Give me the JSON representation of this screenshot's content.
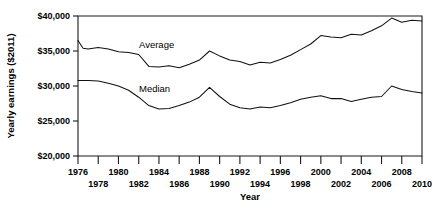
{
  "chart_data": {
    "type": "line",
    "title": "",
    "xlabel": "Year",
    "ylabel": "Yearly earnings ($2011)",
    "xlim": [
      1976,
      2010
    ],
    "ylim": [
      20000,
      40000
    ],
    "grid": false,
    "legend_position": "inline-annotations",
    "y_ticks": [
      20000,
      25000,
      30000,
      35000,
      40000
    ],
    "y_tick_labels": [
      "$20,000",
      "$25,000",
      "$30,000",
      "$35,000",
      "$40,000"
    ],
    "x_ticks": [
      1976,
      1978,
      1980,
      1982,
      1984,
      1986,
      1988,
      1990,
      1992,
      1994,
      1996,
      1998,
      2000,
      2002,
      2004,
      2006,
      2008,
      2010
    ],
    "x_tick_labels": [
      "1976",
      "1978",
      "1980",
      "1982",
      "1984",
      "1986",
      "1988",
      "1990",
      "1992",
      "1994",
      "1996",
      "1998",
      "2000",
      "2002",
      "2004",
      "2006",
      "2008",
      "2010"
    ],
    "x": [
      1976,
      1977,
      1978,
      1979,
      1980,
      1981,
      1982,
      1983,
      1984,
      1985,
      1986,
      1987,
      1988,
      1989,
      1990,
      1991,
      1992,
      1993,
      1994,
      1995,
      1996,
      1997,
      1998,
      1999,
      2000,
      2001,
      2002,
      2003,
      2004,
      2005,
      2006,
      2007,
      2008,
      2009,
      2010
    ],
    "series": [
      {
        "name": "Average",
        "label": "Average",
        "annotation_x": 1981.0,
        "annotation_y": 36400,
        "values": [
          36500,
          35300,
          35500,
          35200,
          34900,
          34800,
          34600,
          33900,
          32800,
          32700,
          32800,
          32600,
          33100,
          33500,
          33900,
          34300,
          35000,
          34300,
          33800,
          33400,
          33400,
          33000,
          33400,
          33600,
          33300,
          33800,
          34700,
          35500,
          36300,
          36800,
          37200,
          37100,
          36900,
          37100,
          37500
        ]
      },
      {
        "name": "Median",
        "label": "Median",
        "annotation_x": 1981.3,
        "annotation_y": 30200,
        "values": [
          30800,
          30800,
          30700,
          30500,
          30200,
          29800,
          29200,
          28200,
          27300,
          26800,
          26700,
          26900,
          27400,
          27900,
          28400,
          29000,
          29800,
          28700,
          27600,
          27000,
          26800,
          26700,
          26900,
          27200,
          27000,
          26900,
          27100,
          27300,
          27500,
          27900,
          28200,
          28500,
          28400,
          28200,
          28300
        ]
      }
    ],
    "series_full": {
      "note_average_tail": [
        37900,
        38300,
        38600,
        38800,
        39100,
        39700,
        39200,
        39400,
        39300
      ],
      "note_median_tail": [
        28300,
        28500,
        28800,
        29100,
        30000,
        29400,
        29200,
        29100
      ]
    },
    "average_points": [
      [
        1976,
        36500
      ],
      [
        1976.5,
        35400
      ],
      [
        1977,
        35300
      ],
      [
        1978,
        35500
      ],
      [
        1979,
        35300
      ],
      [
        1980,
        34900
      ],
      [
        1981,
        34800
      ],
      [
        1982,
        34500
      ],
      [
        1983,
        32800
      ],
      [
        1984,
        32700
      ],
      [
        1985,
        32900
      ],
      [
        1986,
        32600
      ],
      [
        1987,
        33100
      ],
      [
        1988,
        33700
      ],
      [
        1989,
        35000
      ],
      [
        1990,
        34300
      ],
      [
        1991,
        33700
      ],
      [
        1992,
        33500
      ],
      [
        1993,
        33000
      ],
      [
        1994,
        33400
      ],
      [
        1995,
        33300
      ],
      [
        1996,
        33800
      ],
      [
        1997,
        34400
      ],
      [
        1998,
        35200
      ],
      [
        1999,
        36000
      ],
      [
        2000,
        37200
      ],
      [
        2001,
        37000
      ],
      [
        2002,
        36900
      ],
      [
        2003,
        37400
      ],
      [
        2004,
        37300
      ],
      [
        2005,
        37900
      ],
      [
        2006,
        38600
      ],
      [
        2007,
        39700
      ],
      [
        2008,
        39100
      ],
      [
        2009,
        39400
      ],
      [
        2010,
        39300
      ]
    ],
    "median_points": [
      [
        1976,
        30800
      ],
      [
        1977,
        30800
      ],
      [
        1978,
        30700
      ],
      [
        1979,
        30400
      ],
      [
        1980,
        30000
      ],
      [
        1981,
        29400
      ],
      [
        1982,
        28400
      ],
      [
        1983,
        27200
      ],
      [
        1984,
        26700
      ],
      [
        1985,
        26800
      ],
      [
        1986,
        27200
      ],
      [
        1987,
        27700
      ],
      [
        1988,
        28400
      ],
      [
        1989,
        29800
      ],
      [
        1990,
        28500
      ],
      [
        1991,
        27400
      ],
      [
        1992,
        26900
      ],
      [
        1993,
        26700
      ],
      [
        1994,
        27000
      ],
      [
        1995,
        26900
      ],
      [
        1996,
        27200
      ],
      [
        1997,
        27600
      ],
      [
        1998,
        28100
      ],
      [
        1999,
        28400
      ],
      [
        2000,
        28600
      ],
      [
        2001,
        28200
      ],
      [
        2002,
        28200
      ],
      [
        2003,
        27800
      ],
      [
        2004,
        28100
      ],
      [
        2005,
        28400
      ],
      [
        2006,
        28500
      ],
      [
        2007,
        30000
      ],
      [
        2008,
        29500
      ],
      [
        2009,
        29200
      ],
      [
        2010,
        29000
      ]
    ]
  }
}
